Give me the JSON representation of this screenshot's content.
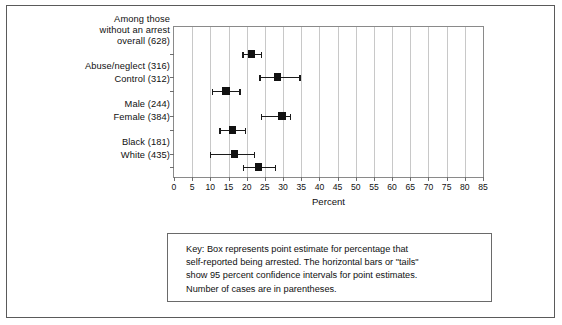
{
  "chart_data": {
    "type": "scatter",
    "title": "",
    "xlabel": "Percent",
    "ylabel": "",
    "xlim": [
      0,
      85
    ],
    "xticks": [
      0,
      5,
      10,
      15,
      20,
      25,
      30,
      35,
      40,
      45,
      50,
      55,
      60,
      65,
      70,
      75,
      80,
      85
    ],
    "xticklabels": [
      "0",
      "5",
      "10",
      "15",
      "20",
      "25",
      "30",
      "35",
      "40",
      "45",
      "50",
      "55",
      "60",
      "65",
      "70",
      "75",
      "80",
      "85"
    ],
    "grid": "vertical",
    "legend_position": "below-plot-box",
    "categories": [
      "Among those without an arrest overall (628)",
      "Abuse/neglect (316)",
      "Control (312)",
      "Male (244)",
      "Female (384)",
      "Black (181)",
      "White (435)"
    ],
    "series": [
      {
        "name": "Percent self-reported being arrested",
        "point_estimates": [
          21.4,
          28.5,
          14.3,
          29.7,
          16.1,
          16.7,
          23.2
        ],
        "ci_low": [
          18.8,
          23.5,
          10.5,
          24.0,
          12.5,
          9.8,
          19.0
        ],
        "ci_high": [
          23.9,
          34.5,
          18.0,
          31.8,
          19.5,
          21.9,
          27.8
        ]
      }
    ],
    "annotations": [
      "Key: Box represents point estimate for percentage that self-reported being arrested. The horizontal bars or \"tails\" show 95 percent confidence intervals for point estimates. Number of cases are in parentheses."
    ]
  },
  "rows": [
    {
      "label": "Among those\nwithout an arrest\noverall (628)",
      "short_name": "overall",
      "n": 628,
      "estimate": 21.4,
      "ci_low": 18.8,
      "ci_high": 23.9,
      "label_top": 0,
      "y": 27
    },
    {
      "label": "Abuse/neglect (316)",
      "short_name": "abuse-neglect",
      "n": 316,
      "estimate": 28.5,
      "ci_low": 23.5,
      "ci_high": 34.5,
      "label_top": 47,
      "y": 50
    },
    {
      "label": "Control (312)",
      "short_name": "control",
      "n": 312,
      "estimate": 14.3,
      "ci_low": 10.5,
      "ci_high": 18.0,
      "label_top": 60,
      "y": 64
    },
    {
      "label": "Male (244)",
      "short_name": "male",
      "n": 244,
      "estimate": 29.7,
      "ci_low": 24.0,
      "ci_high": 31.8,
      "label_top": 85,
      "y": 89
    },
    {
      "label": "Female (384)",
      "short_name": "female",
      "n": 384,
      "estimate": 16.1,
      "ci_low": 12.5,
      "ci_high": 19.5,
      "label_top": 98,
      "y": 103
    },
    {
      "label": "Black (181)",
      "short_name": "black",
      "n": 181,
      "estimate": 16.7,
      "ci_low": 9.8,
      "ci_high": 21.9,
      "label_top": 123,
      "y": 127
    },
    {
      "label": "White (435)",
      "short_name": "white",
      "n": 435,
      "estimate": 23.2,
      "ci_low": 19.0,
      "ci_high": 27.8,
      "label_top": 136,
      "y": 140
    }
  ],
  "axis": {
    "x_title": "Percent",
    "x_min": 0,
    "x_max": 85,
    "x_tick_step": 5
  },
  "key": {
    "lines": [
      "Key: Box represents point estimate for percentage that",
      "self-reported being arrested. The horizontal bars or \"tails\"",
      "show 95 percent confidence intervals for point estimates.",
      "Number of cases are in parentheses."
    ]
  },
  "colors": {
    "marker": "#111111",
    "gridline": "#c8c8c8",
    "frame": "#5a5a5a",
    "plot_border": "#8a8a8a",
    "text": "#101010",
    "background": "#ffffff"
  }
}
